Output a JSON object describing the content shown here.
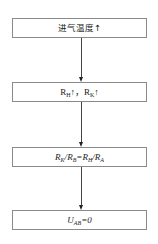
{
  "diagram": {
    "type": "flowchart",
    "direction": "top-to-bottom",
    "nodes": [
      {
        "id": "n1",
        "text": "进气温度",
        "suffix": "↑"
      },
      {
        "id": "n2",
        "parts": {
          "r1": "R",
          "r1_sub": "H",
          "r1_arrow": "↑",
          "sep": "，",
          "r2": "R",
          "r2_sub": "K",
          "r2_arrow": "↑"
        }
      },
      {
        "id": "n3",
        "parts": {
          "a": "R",
          "a_sub": "K",
          "slash1": "/",
          "b": "R",
          "b_sub": "B",
          "eq": "=",
          "c": "R",
          "c_sub": "H",
          "slash2": "/",
          "d": "R",
          "d_sub": "A"
        }
      },
      {
        "id": "n4",
        "parts": {
          "u": "U",
          "u_sub": "AB",
          "eq": "=0"
        }
      }
    ],
    "edges": [
      {
        "from": "n1",
        "to": "n2"
      },
      {
        "from": "n2",
        "to": "n3"
      },
      {
        "from": "n3",
        "to": "n4"
      }
    ],
    "colors": {
      "box_border": "#8a8a8a",
      "line": "#444444",
      "text": "#222222",
      "background": "#ffffff"
    }
  }
}
